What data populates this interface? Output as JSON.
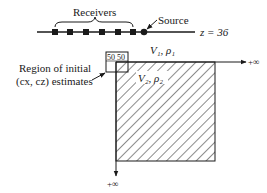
{
  "figure": {
    "surface": {
      "label": "z = 36",
      "receivers_label": "Receivers",
      "source_label": "Source",
      "receiver_count": 6
    },
    "layer1": {
      "label": "V₁, ρ₁"
    },
    "layer2": {
      "label": "V₂, ρ₂"
    },
    "initial_box": {
      "label": "50 50"
    },
    "region_annotation": {
      "line1": "Region of initial",
      "line2": "(cx, cz) estimates"
    },
    "axes": {
      "x_end_label": "+∞",
      "z_end_label": "+∞"
    },
    "colors": {
      "ink": "#1a1a1a",
      "background": "#ffffff"
    }
  }
}
